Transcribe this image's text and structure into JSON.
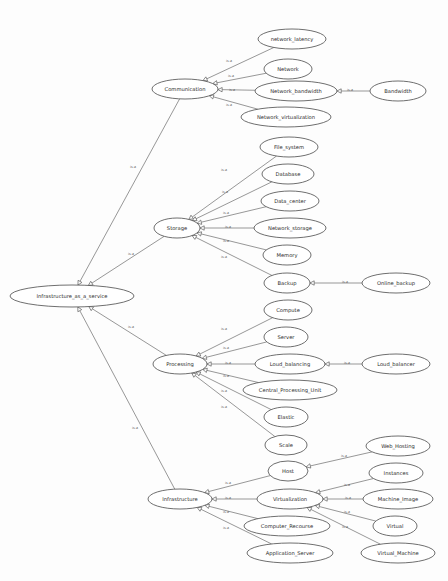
{
  "canvas": {
    "width": 448,
    "height": 581,
    "background": "#fdfdfd"
  },
  "style": {
    "node_fill": "#ffffff",
    "node_stroke": "#4a4a4a",
    "edge_stroke": "#6b6b6b",
    "node_font_size": 5.2,
    "edge_font_size": 3.4,
    "arrow_size": 4.2
  },
  "graph": {
    "title": "Infrastructure_as_a_service ontology",
    "relation_label": "is-a",
    "nodes": [
      {
        "id": "iaas",
        "label": "Infrastructure_as_a_service",
        "cx": 72,
        "cy": 296,
        "rx": 62,
        "ry": 11
      },
      {
        "id": "comm",
        "label": "Communication",
        "cx": 185,
        "cy": 89,
        "rx": 33,
        "ry": 10
      },
      {
        "id": "netlat",
        "label": "network_latency",
        "cx": 292,
        "cy": 39,
        "rx": 34,
        "ry": 10
      },
      {
        "id": "net",
        "label": "Network",
        "cx": 288,
        "cy": 69,
        "rx": 24,
        "ry": 10
      },
      {
        "id": "netbw",
        "label": "Network_bandwidth",
        "cx": 296,
        "cy": 91,
        "rx": 41,
        "ry": 10
      },
      {
        "id": "bw",
        "label": "Bandwidth",
        "cx": 398,
        "cy": 91,
        "rx": 28,
        "ry": 10
      },
      {
        "id": "netvirt",
        "label": "Network_virtualization",
        "cx": 286,
        "cy": 117,
        "rx": 45,
        "ry": 10
      },
      {
        "id": "storage",
        "label": "Storage",
        "cx": 177,
        "cy": 228,
        "rx": 23,
        "ry": 10
      },
      {
        "id": "fs",
        "label": "File_system",
        "cx": 289,
        "cy": 147,
        "rx": 29,
        "ry": 10
      },
      {
        "id": "db",
        "label": "Database",
        "cx": 288,
        "cy": 174,
        "rx": 26,
        "ry": 10
      },
      {
        "id": "dc",
        "label": "Data_center",
        "cx": 290,
        "cy": 201,
        "rx": 29,
        "ry": 10
      },
      {
        "id": "netstor",
        "label": "Network_storage",
        "cx": 290,
        "cy": 228,
        "rx": 36,
        "ry": 10
      },
      {
        "id": "mem",
        "label": "Memory",
        "cx": 287,
        "cy": 255,
        "rx": 24,
        "ry": 10
      },
      {
        "id": "backup",
        "label": "Backup",
        "cx": 287,
        "cy": 283,
        "rx": 23,
        "ry": 10
      },
      {
        "id": "onbk",
        "label": "Online_backup",
        "cx": 396,
        "cy": 283,
        "rx": 34,
        "ry": 10
      },
      {
        "id": "proc",
        "label": "Processing",
        "cx": 180,
        "cy": 364,
        "rx": 27,
        "ry": 10
      },
      {
        "id": "compute",
        "label": "Compute",
        "cx": 288,
        "cy": 310,
        "rx": 24,
        "ry": 10
      },
      {
        "id": "server",
        "label": "Server",
        "cx": 286,
        "cy": 337,
        "rx": 22,
        "ry": 10
      },
      {
        "id": "loudbal",
        "label": "Loud_balancing",
        "cx": 290,
        "cy": 364,
        "rx": 35,
        "ry": 10
      },
      {
        "id": "loudbr",
        "label": "Loud_balancer",
        "cx": 396,
        "cy": 364,
        "rx": 34,
        "ry": 10
      },
      {
        "id": "cpu",
        "label": "Central_Processing_Unit",
        "cx": 290,
        "cy": 390,
        "rx": 47,
        "ry": 10
      },
      {
        "id": "elastic",
        "label": "Elastic",
        "cx": 286,
        "cy": 417,
        "rx": 22,
        "ry": 10
      },
      {
        "id": "scale",
        "label": "Scale",
        "cx": 286,
        "cy": 445,
        "rx": 21,
        "ry": 10
      },
      {
        "id": "infra",
        "label": "Infrastructure",
        "cx": 180,
        "cy": 499,
        "rx": 32,
        "ry": 10
      },
      {
        "id": "host",
        "label": "Host",
        "cx": 288,
        "cy": 471,
        "rx": 20,
        "ry": 10
      },
      {
        "id": "virt",
        "label": "Virtualization",
        "cx": 290,
        "cy": 499,
        "rx": 33,
        "ry": 10
      },
      {
        "id": "cres",
        "label": "Computer_Recourse",
        "cx": 287,
        "cy": 526,
        "rx": 43,
        "ry": 10
      },
      {
        "id": "appsrv",
        "label": "Application_Server",
        "cx": 290,
        "cy": 553,
        "rx": 43,
        "ry": 10
      },
      {
        "id": "webhost",
        "label": "Web_Hosting",
        "cx": 398,
        "cy": 446,
        "rx": 32,
        "ry": 10
      },
      {
        "id": "inst",
        "label": "Instances",
        "cx": 396,
        "cy": 473,
        "rx": 27,
        "ry": 10
      },
      {
        "id": "mimg",
        "label": "Machine_Image",
        "cx": 398,
        "cy": 499,
        "rx": 35,
        "ry": 10
      },
      {
        "id": "virtual",
        "label": "Virtual",
        "cx": 395,
        "cy": 526,
        "rx": 22,
        "ry": 10
      },
      {
        "id": "vm",
        "label": "Virtual_Machine",
        "cx": 398,
        "cy": 553,
        "rx": 37,
        "ry": 10
      }
    ],
    "edges": [
      {
        "from": "comm",
        "to": "iaas",
        "label": "is-a",
        "lx": 133,
        "ly": 167
      },
      {
        "from": "storage",
        "to": "iaas",
        "label": "is-a",
        "lx": 131,
        "ly": 254
      },
      {
        "from": "proc",
        "to": "iaas",
        "label": "is-a",
        "lx": 131,
        "ly": 327
      },
      {
        "from": "infra",
        "to": "iaas",
        "label": "is-a",
        "lx": 135,
        "ly": 428
      },
      {
        "from": "netlat",
        "to": "comm",
        "label": "is-a",
        "lx": 229,
        "ly": 61
      },
      {
        "from": "net",
        "to": "comm",
        "label": "is-a",
        "lx": 231,
        "ly": 76
      },
      {
        "from": "netbw",
        "to": "comm",
        "label": "is-a",
        "lx": 232,
        "ly": 90
      },
      {
        "from": "netvirt",
        "to": "comm",
        "label": "is-a",
        "lx": 229,
        "ly": 105
      },
      {
        "from": "bw",
        "to": "netbw",
        "label": "is-a",
        "lx": 350,
        "ly": 90
      },
      {
        "from": "fs",
        "to": "storage",
        "label": "is-a",
        "lx": 224,
        "ly": 170
      },
      {
        "from": "db",
        "to": "storage",
        "label": "is-a",
        "lx": 225,
        "ly": 192
      },
      {
        "from": "dc",
        "to": "storage",
        "label": "is-a",
        "lx": 226,
        "ly": 213
      },
      {
        "from": "netstor",
        "to": "storage",
        "label": "is-a",
        "lx": 228,
        "ly": 227
      },
      {
        "from": "mem",
        "to": "storage",
        "label": "is-a",
        "lx": 226,
        "ly": 241
      },
      {
        "from": "backup",
        "to": "storage",
        "label": "is-a",
        "lx": 224,
        "ly": 257
      },
      {
        "from": "onbk",
        "to": "backup",
        "label": "is-a",
        "lx": 345,
        "ly": 282
      },
      {
        "from": "compute",
        "to": "proc",
        "label": "is-a",
        "lx": 224,
        "ly": 329
      },
      {
        "from": "server",
        "to": "proc",
        "label": "is-a",
        "lx": 226,
        "ly": 348
      },
      {
        "from": "loudbal",
        "to": "proc",
        "label": "is-a",
        "lx": 228,
        "ly": 363
      },
      {
        "from": "cpu",
        "to": "proc",
        "label": "is-a",
        "lx": 226,
        "ly": 376
      },
      {
        "from": "elastic",
        "to": "proc",
        "label": "is-a",
        "lx": 224,
        "ly": 391
      },
      {
        "from": "scale",
        "to": "proc",
        "label": "is-a",
        "lx": 224,
        "ly": 407
      },
      {
        "from": "loudbr",
        "to": "loudbal",
        "label": "is-a",
        "lx": 347,
        "ly": 363
      },
      {
        "from": "host",
        "to": "infra",
        "label": "is-a",
        "lx": 228,
        "ly": 483
      },
      {
        "from": "virt",
        "to": "infra",
        "label": "is-a",
        "lx": 228,
        "ly": 498
      },
      {
        "from": "cres",
        "to": "infra",
        "label": "is-a",
        "lx": 226,
        "ly": 512
      },
      {
        "from": "appsrv",
        "to": "infra",
        "label": "is-a",
        "lx": 226,
        "ly": 528
      },
      {
        "from": "webhost",
        "to": "host",
        "label": "is-a",
        "lx": 344,
        "ly": 456
      },
      {
        "from": "inst",
        "to": "virt",
        "label": "is-a",
        "lx": 347,
        "ly": 485
      },
      {
        "from": "mimg",
        "to": "virt",
        "label": "is-a",
        "lx": 348,
        "ly": 498
      },
      {
        "from": "virtual",
        "to": "virt",
        "label": "is-a",
        "lx": 347,
        "ly": 512
      },
      {
        "from": "vm",
        "to": "virt",
        "label": "is-a",
        "lx": 345,
        "ly": 527
      }
    ]
  }
}
